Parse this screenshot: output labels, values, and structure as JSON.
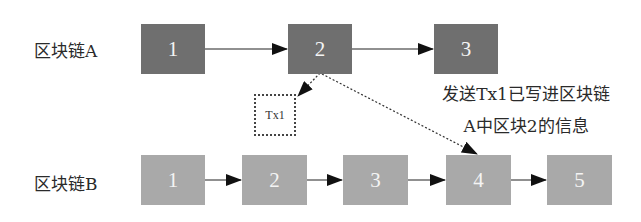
{
  "diagram": {
    "chain_a": {
      "label": "区块链A",
      "color": "#6f6f6f",
      "blocks": [
        {
          "label": "1"
        },
        {
          "label": "2"
        },
        {
          "label": "3"
        }
      ]
    },
    "chain_b": {
      "label": "区块链B",
      "color": "#a9a9a9",
      "blocks": [
        {
          "label": "1"
        },
        {
          "label": "2"
        },
        {
          "label": "3"
        },
        {
          "label": "4"
        },
        {
          "label": "5"
        }
      ]
    },
    "transaction": {
      "label": "Tx1"
    },
    "note": {
      "line1": "发送Tx1已写进区块链",
      "line2": "A中区块2的信息"
    }
  }
}
